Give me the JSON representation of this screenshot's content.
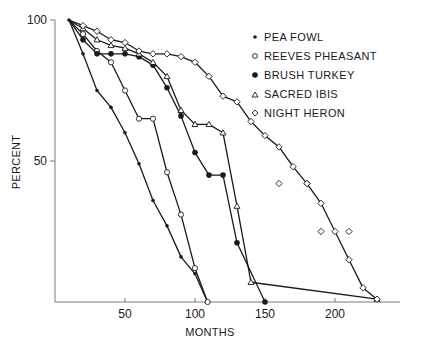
{
  "chart_data": {
    "type": "line",
    "title": "",
    "xlabel": "MONTHS",
    "ylabel": "PERCENT",
    "xlim": [
      0,
      240
    ],
    "ylim": [
      0,
      100
    ],
    "x_ticks": [
      50,
      100,
      150,
      200
    ],
    "y_ticks": [
      50,
      100
    ],
    "grid": false,
    "legend_position": "upper right",
    "legend": [
      "PEA FOWL",
      "REEVES PHEASANT",
      "BRUSH TURKEY",
      "SACRED IBIS",
      "NIGHT HERON"
    ],
    "series": [
      {
        "name": "PEA FOWL",
        "marker": "small-dot",
        "x": [
          10,
          20,
          30,
          40,
          50,
          60,
          70,
          80,
          90,
          100,
          109
        ],
        "y": [
          100,
          88,
          75,
          69,
          60,
          49,
          36,
          27,
          16,
          10,
          0
        ]
      },
      {
        "name": "REEVES PHEASANT",
        "marker": "open-circle",
        "x": [
          10,
          20,
          30,
          40,
          50,
          60,
          70,
          80,
          90,
          100,
          109
        ],
        "y": [
          100,
          95,
          89,
          85,
          75,
          65,
          65,
          46,
          31,
          12,
          0
        ]
      },
      {
        "name": "BRUSH TURKEY",
        "marker": "filled-circle",
        "x": [
          10,
          20,
          30,
          40,
          50,
          60,
          70,
          80,
          90,
          100,
          110,
          120,
          130,
          150
        ],
        "y": [
          100,
          93,
          88,
          88,
          88,
          87,
          84,
          76,
          66,
          53,
          45,
          45,
          21,
          0
        ]
      },
      {
        "name": "SACRED IBIS",
        "marker": "open-triangle",
        "x": [
          10,
          20,
          30,
          40,
          50,
          60,
          70,
          80,
          90,
          100,
          110,
          120,
          130,
          140,
          230
        ],
        "y": [
          100,
          97,
          93,
          91,
          90,
          88,
          85,
          80,
          68,
          63,
          63,
          60,
          34,
          7,
          1
        ]
      },
      {
        "name": "NIGHT HERON",
        "marker": "open-diamond",
        "x": [
          10,
          20,
          30,
          40,
          50,
          60,
          70,
          80,
          90,
          100,
          110,
          120,
          130,
          140,
          150,
          160,
          170,
          180,
          190,
          200,
          210,
          220,
          230
        ],
        "y": [
          100,
          98,
          96,
          93,
          92,
          89,
          88,
          88,
          87,
          85,
          80,
          73,
          71,
          64,
          59,
          55,
          48,
          42,
          35,
          25,
          15,
          5,
          1
        ]
      },
      {
        "name": "NIGHT HERON (unconnected points)",
        "marker": "open-diamond",
        "x": [
          160,
          180,
          190,
          210
        ],
        "y": [
          42,
          42,
          25,
          25
        ]
      }
    ]
  },
  "axes": {
    "y_tick_100": "100",
    "y_tick_50": "50",
    "x_tick_50": "50",
    "x_tick_100": "100",
    "x_tick_150": "150",
    "x_tick_200": "200",
    "xlabel": "MONTHS",
    "ylabel": "PERCENT"
  },
  "legend": {
    "items": [
      {
        "label": "PEA FOWL",
        "marker": "small-dot"
      },
      {
        "label": "REEVES PHEASANT",
        "marker": "open-circle"
      },
      {
        "label": "BRUSH TURKEY",
        "marker": "filled-circle"
      },
      {
        "label": "SACRED IBIS",
        "marker": "open-triangle"
      },
      {
        "label": "NIGHT HERON",
        "marker": "open-diamond"
      }
    ]
  },
  "colors": {
    "ink": "#1a1a1a",
    "axis": "#7a7a7a",
    "background": "#ffffff"
  }
}
